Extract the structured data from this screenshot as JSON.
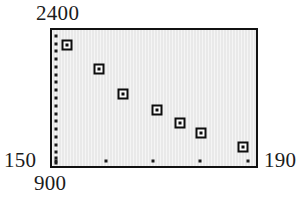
{
  "chart_data": {
    "type": "scatter",
    "title": "",
    "subtitle": "",
    "xlabel": "",
    "ylabel": "",
    "grid": false,
    "legend": null,
    "legend_position": "none",
    "xlim": [
      900,
      190
    ],
    "ylim": [
      150,
      2400
    ],
    "axis_corner_labels": {
      "y_max": "2400",
      "y_min": "150",
      "x_min": "900",
      "x_max": "190"
    },
    "x_tick_count": 5,
    "y_tick_count": 18,
    "x_tick_positions_frac": [
      0.019,
      0.264,
      0.495,
      0.726,
      0.962
    ],
    "y_tick_positions_frac": [
      0.043,
      0.1,
      0.157,
      0.214,
      0.271,
      0.329,
      0.386,
      0.443,
      0.5,
      0.557,
      0.614,
      0.671,
      0.729,
      0.786,
      0.843,
      0.9,
      0.943,
      0.979
    ],
    "marker_style": "open-square-with-center-dot",
    "series": [
      {
        "name": "series-1",
        "x": [
          907,
          916,
          923,
          932,
          938,
          944,
          955
        ],
        "y": [
          2240,
          1970,
          1690,
          1520,
          1370,
          1260,
          1110
        ],
        "points_frac": [
          {
            "fx": 0.072,
            "fy": 0.107
          },
          {
            "fx": 0.231,
            "fy": 0.286
          },
          {
            "fx": 0.346,
            "fy": 0.471
          },
          {
            "fx": 0.514,
            "fy": 0.586
          },
          {
            "fx": 0.625,
            "fy": 0.686
          },
          {
            "fx": 0.731,
            "fy": 0.757
          },
          {
            "fx": 0.938,
            "fy": 0.857
          }
        ]
      }
    ],
    "colors": {
      "plot_background": "#e9e9e9",
      "frame": "#111111",
      "marker": "#0d0d0d",
      "marker_fill": "#fbfbfb",
      "text": "#1b1b1b",
      "page_background": "#ffffff"
    }
  }
}
